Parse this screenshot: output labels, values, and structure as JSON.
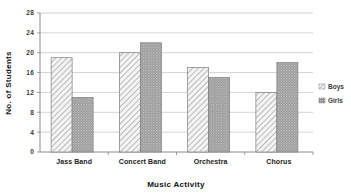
{
  "chart_data": {
    "type": "bar",
    "title": "",
    "categories": [
      "Jass Band",
      "Concert Band",
      "Orchestra",
      "Chorus"
    ],
    "series": [
      {
        "name": "Boys",
        "values": [
          19,
          20,
          17,
          12
        ]
      },
      {
        "name": "Girls",
        "values": [
          11,
          22,
          15,
          18
        ]
      }
    ],
    "xlabel": "Music Activity",
    "ylabel": "No. of Students",
    "ylim": [
      0,
      28
    ],
    "yticks": [
      0,
      4,
      8,
      12,
      16,
      20,
      24,
      28
    ],
    "ytick_labels": [
      "0",
      "4",
      "8",
      "12",
      "16",
      "20",
      "24",
      "28"
    ],
    "grid": true,
    "legend_position": "right",
    "colors": {
      "boys_fill": "#f2f2f2",
      "boys_hatch": "#9a9a9a",
      "girls_fill": "#8e8e8e",
      "girls_dot": "#5a5a5a",
      "grid": "#c9c9c9",
      "axis": "#8a8a8a",
      "text": "#2b2b2b",
      "background": "#ffffff"
    }
  },
  "legend": {
    "items": [
      {
        "label": "Boys",
        "swatch": "diagonal-hatch-swatch"
      },
      {
        "label": "Girls",
        "swatch": "dotted-swatch"
      }
    ]
  }
}
